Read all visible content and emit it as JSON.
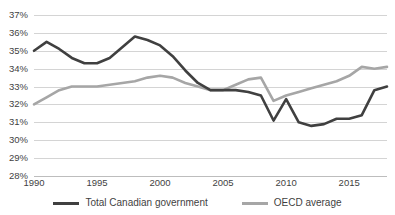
{
  "chart_data": {
    "type": "line",
    "title": "",
    "subtitle": "",
    "xlabel": "",
    "ylabel": "",
    "xlim": [
      1990,
      2018
    ],
    "ylim": [
      28,
      37
    ],
    "y_tick_labels": [
      "37%",
      "36%",
      "35%",
      "34%",
      "33%",
      "32%",
      "31%",
      "30%",
      "29%",
      "28%"
    ],
    "y_tick_values": [
      37,
      36,
      35,
      34,
      33,
      32,
      31,
      30,
      29,
      28
    ],
    "x_tick_labels": [
      "1990",
      "1995",
      "2000",
      "2005",
      "2010",
      "2015"
    ],
    "x_tick_values": [
      1990,
      1995,
      2000,
      2005,
      2010,
      2015
    ],
    "grid": true,
    "legend_position": "bottom",
    "x": [
      1990,
      1991,
      1992,
      1993,
      1994,
      1995,
      1996,
      1997,
      1998,
      1999,
      2000,
      2001,
      2002,
      2003,
      2004,
      2005,
      2006,
      2007,
      2008,
      2009,
      2010,
      2011,
      2012,
      2013,
      2014,
      2015,
      2016,
      2017,
      2018
    ],
    "series": [
      {
        "name": "Total Canadian government",
        "color": "#404040",
        "values": [
          35.0,
          35.5,
          35.1,
          34.6,
          34.3,
          34.3,
          34.6,
          35.2,
          35.8,
          35.6,
          35.3,
          34.7,
          33.9,
          33.2,
          32.8,
          32.8,
          32.8,
          32.7,
          32.5,
          31.1,
          32.3,
          31.0,
          30.8,
          30.9,
          31.2,
          31.2,
          31.4,
          32.8,
          33.0
        ]
      },
      {
        "name": "OECD average",
        "color": "#a6a6a6",
        "values": [
          32.0,
          32.4,
          32.8,
          33.0,
          33.0,
          33.0,
          33.1,
          33.2,
          33.3,
          33.5,
          33.6,
          33.5,
          33.2,
          33.0,
          32.8,
          32.8,
          33.1,
          33.4,
          33.5,
          32.2,
          32.5,
          32.7,
          32.9,
          33.1,
          33.3,
          33.6,
          34.1,
          34.0,
          34.1
        ]
      }
    ],
    "legend": [
      {
        "label": "Total Canadian government",
        "color": "#404040"
      },
      {
        "label": "OECD average",
        "color": "#a6a6a6"
      }
    ]
  }
}
